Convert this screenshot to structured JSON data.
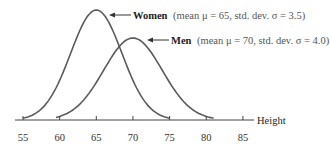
{
  "chart_data": {
    "type": "line",
    "title": "",
    "xlabel": "Height",
    "ylabel": "",
    "xlim": [
      55,
      85
    ],
    "x_ticks": [
      55,
      60,
      65,
      70,
      75,
      80,
      85
    ],
    "grid": false,
    "series": [
      {
        "name": "Women",
        "mean": 65,
        "std_dev": 3.5,
        "annotation": "(mean μ = 65, std. dev. σ = 3.5)",
        "color": "#555555"
      },
      {
        "name": "Men",
        "mean": 70,
        "std_dev": 4.0,
        "annotation": "(mean μ = 70, std. dev. σ = 4.0)",
        "color": "#555555"
      }
    ]
  },
  "labels": {
    "women_name": "Women",
    "women_detail": "(mean μ = 65, std. dev. σ = 3.5)",
    "men_name": "Men",
    "men_detail": "(mean μ = 70, std. dev. σ = 4.0)",
    "axis_label": "Height",
    "ticks": [
      "55",
      "60",
      "65",
      "70",
      "75",
      "80",
      "85"
    ]
  }
}
